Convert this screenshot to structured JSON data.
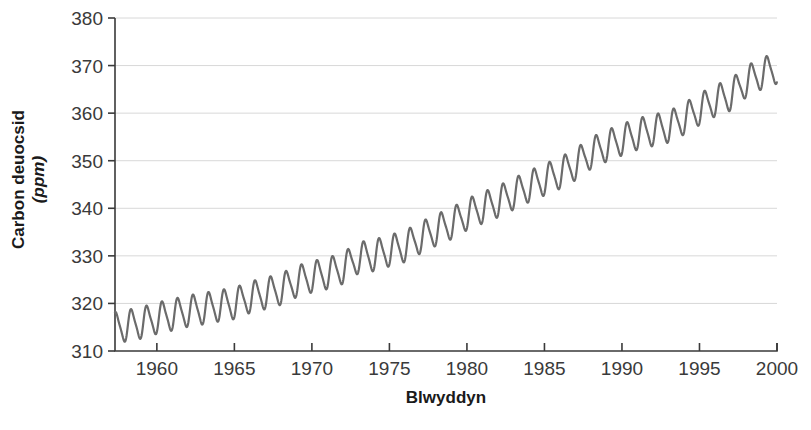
{
  "chart_data": {
    "type": "line",
    "title": "",
    "xlabel": "Blwyddyn",
    "ylabel_line1": "Carbon deuocsid",
    "ylabel_line2": "(ppm)",
    "xlim": [
      1957.3,
      2000
    ],
    "ylim": [
      310,
      380
    ],
    "xticks": [
      1960,
      1965,
      1970,
      1975,
      1980,
      1985,
      1990,
      1995,
      2000
    ],
    "yticks": [
      310,
      320,
      330,
      340,
      350,
      360,
      370,
      380
    ],
    "xtick_labels": [
      "1960",
      "1965",
      "1970",
      "1975",
      "1980",
      "1985",
      "1990",
      "1995",
      "2000"
    ],
    "ytick_labels": [
      "310",
      "320",
      "330",
      "340",
      "350",
      "360",
      "370",
      "380"
    ],
    "grid": "horizontal",
    "legend": "none",
    "line_color": "#6b6b6b",
    "line_width": 2.2,
    "series": [
      {
        "name": "Carbon deuocsid",
        "description": "Monthly mean atmospheric CO2 concentration showing a rising trend with a seasonal oscillation of about 6 ppm peak-to-trough.",
        "annual_mean_x": [
          1958,
          1959,
          1960,
          1961,
          1962,
          1963,
          1964,
          1965,
          1966,
          1967,
          1968,
          1969,
          1970,
          1971,
          1972,
          1973,
          1974,
          1975,
          1976,
          1977,
          1978,
          1979,
          1980,
          1981,
          1982,
          1983,
          1984,
          1985,
          1986,
          1987,
          1988,
          1989,
          1990,
          1991,
          1992,
          1993,
          1994,
          1995,
          1996,
          1997,
          1998,
          1999,
          2000
        ],
        "annual_mean_y": [
          315.3,
          315.9,
          316.9,
          317.6,
          318.4,
          318.9,
          319.5,
          320.0,
          321.3,
          322.1,
          323.0,
          324.6,
          325.6,
          326.3,
          327.4,
          329.6,
          330.1,
          331.1,
          332.0,
          333.8,
          335.4,
          336.8,
          338.7,
          340.1,
          341.4,
          343.0,
          344.6,
          346.0,
          347.4,
          349.2,
          351.6,
          353.1,
          354.4,
          355.6,
          356.4,
          357.1,
          358.8,
          360.8,
          362.6,
          363.8,
          366.6,
          368.3,
          369.5
        ],
        "seasonal_amplitude": 3.1,
        "start_value": 316,
        "end_value": 368,
        "peak_value": 372
      }
    ]
  }
}
